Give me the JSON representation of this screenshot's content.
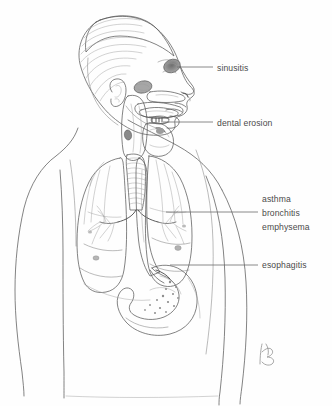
{
  "illustration": {
    "title": "Upper body anatomical illustration of reflux-related conditions",
    "subject": "head, neck, lungs, trachea, esophagus and stomach in profile",
    "background_color": "#fefefe",
    "line_color": "#5a5a5a",
    "label_text_color": "#4b4b4b",
    "leader_line_color": "#6d6d6d",
    "shading_light": "#e2e2e2",
    "shading_mid": "#c6c6c6",
    "shading_dark": "#8f8f8f"
  },
  "labels": [
    {
      "id": "sinusitis",
      "text": "sinusitis",
      "text_x": 217,
      "text_y": 71,
      "leader": {
        "x1": 177,
        "y1": 67,
        "x2": 213,
        "y2": 67
      },
      "target": "frontal sinus"
    },
    {
      "id": "dental-erosion",
      "text": "dental erosion",
      "text_x": 217,
      "text_y": 126,
      "leader": {
        "x1": 163,
        "y1": 122,
        "x2": 213,
        "y2": 122
      },
      "target": "teeth"
    },
    {
      "id": "asthma",
      "text": "asthma",
      "text_x": 262,
      "text_y": 202,
      "leader": null,
      "target": "lungs"
    },
    {
      "id": "bronchitis",
      "text": "bronchitis",
      "text_x": 262,
      "text_y": 216,
      "leader": {
        "x1": 166,
        "y1": 212,
        "x2": 258,
        "y2": 212
      },
      "target": "bronchi"
    },
    {
      "id": "emphysema",
      "text": "emphysema",
      "text_x": 262,
      "text_y": 230,
      "leader": null,
      "target": "lung parenchyma"
    },
    {
      "id": "esophagitis",
      "text": "esophagitis",
      "text_x": 262,
      "text_y": 268,
      "leader": {
        "x1": 170,
        "y1": 265,
        "x2": 258,
        "y2": 265
      },
      "target": "lower esophagus"
    }
  ],
  "signature": {
    "present": true,
    "mark": "KB",
    "x": 258,
    "y": 346
  },
  "anatomy_parts": [
    "head-profile",
    "hair",
    "ear",
    "frontal-sinus",
    "maxillary-sinus",
    "nasal-cavity",
    "oral-cavity",
    "tongue",
    "teeth",
    "pharynx",
    "larynx",
    "trachea",
    "left-lung",
    "right-lung",
    "bronchial-tree",
    "esophagus",
    "stomach",
    "torso-outline",
    "left-arm",
    "right-arm"
  ]
}
